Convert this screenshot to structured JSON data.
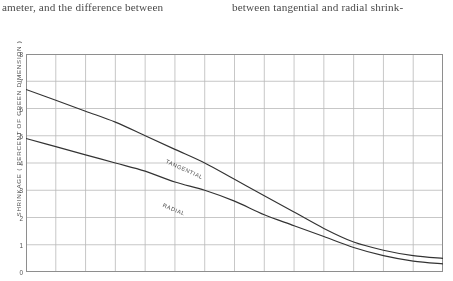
{
  "page": {
    "columns": [
      {
        "text": "ameter, and the difference between"
      },
      {
        "text": "between tangential and radial shrink-"
      }
    ]
  },
  "figure": {
    "y_axis_caption": "SHRINKAGE ( PERCENT  OF  GREEN  DIMENSION )",
    "tangential_label": "TANGENTIAL",
    "radial_label": "RADIAL",
    "colors": {
      "curve": "#333333",
      "grid": "#b9b9b9",
      "frame": "#8e8e8e",
      "text": "#2e2e2e",
      "background": "#ffffff"
    }
  },
  "chart_data": {
    "type": "line",
    "title": "",
    "xlabel": "",
    "ylabel": "SHRINKAGE ( PERCENT OF GREEN DIMENSION )",
    "ylim": [
      0,
      8
    ],
    "yticks": [
      0,
      1,
      2,
      3,
      4,
      5,
      6,
      7,
      8
    ],
    "ytick_labels": [
      "0",
      "1",
      "2",
      "3",
      "4",
      "5",
      "6",
      "7",
      "8"
    ],
    "xlim": [
      0,
      14
    ],
    "xticks": [
      0,
      1,
      2,
      3,
      4,
      5,
      6,
      7,
      8,
      9,
      10,
      11,
      12,
      13,
      14
    ],
    "xtick_labels": [],
    "grid": true,
    "legend": "inline-curve-labels",
    "x": [
      0,
      1,
      2,
      3,
      4,
      5,
      6,
      7,
      8,
      9,
      10,
      11,
      12,
      13,
      14
    ],
    "series": [
      {
        "name": "TANGENTIAL",
        "values": [
          6.7,
          6.3,
          5.9,
          5.5,
          5.0,
          4.5,
          4.0,
          3.4,
          2.8,
          2.2,
          1.6,
          1.1,
          0.8,
          0.6,
          0.5
        ]
      },
      {
        "name": "RADIAL",
        "values": [
          4.9,
          4.6,
          4.3,
          4.0,
          3.7,
          3.3,
          3.0,
          2.6,
          2.1,
          1.7,
          1.3,
          0.9,
          0.6,
          0.4,
          0.3
        ]
      }
    ]
  }
}
